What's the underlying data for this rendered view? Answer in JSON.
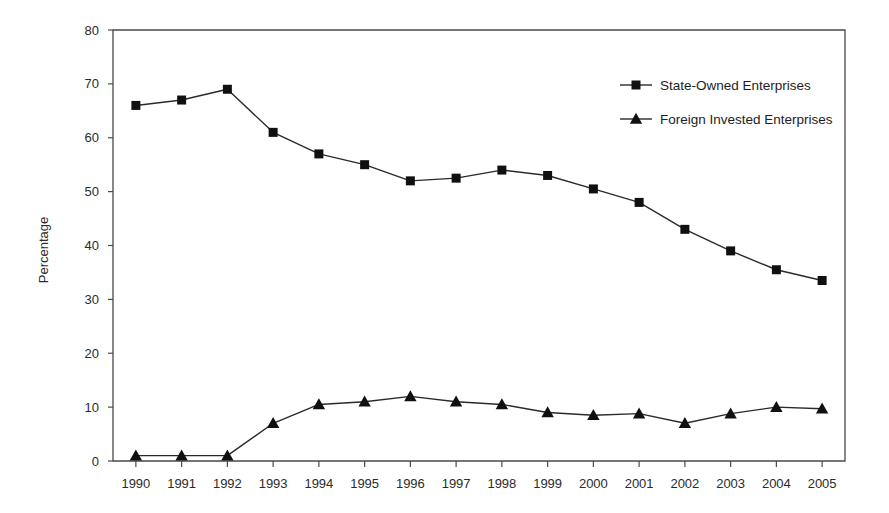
{
  "chart_data": {
    "type": "line",
    "title": "",
    "subtitle": "",
    "xlabel": "",
    "ylabel": "Percentage",
    "xlim": [
      1989.5,
      2005.5
    ],
    "ylim": [
      0,
      80
    ],
    "y_ticks": [
      0,
      10,
      20,
      30,
      40,
      50,
      60,
      70,
      80
    ],
    "grid": false,
    "legend_position": "top-right",
    "categories": [
      "1990",
      "1991",
      "1992",
      "1993",
      "1994",
      "1995",
      "1996",
      "1997",
      "1998",
      "1999",
      "2000",
      "2001",
      "2002",
      "2003",
      "2004",
      "2005"
    ],
    "series": [
      {
        "name": "State-Owned Enterprises",
        "marker": "square",
        "color": "#101010",
        "values": [
          66,
          67,
          69,
          61,
          57,
          55,
          52,
          52.5,
          54,
          53,
          50.5,
          48,
          43,
          39,
          35.5,
          33.5
        ]
      },
      {
        "name": "Foreign Invested Enterprises",
        "marker": "triangle",
        "color": "#101010",
        "values": [
          1,
          1,
          1,
          7,
          10.5,
          11,
          12,
          11,
          10.5,
          9,
          8.5,
          8.8,
          7,
          8.8,
          10,
          9.7
        ]
      }
    ]
  },
  "axes": {
    "y_label": "Percentage",
    "y_tick_labels": [
      "0",
      "10",
      "20",
      "30",
      "40",
      "50",
      "60",
      "70",
      "80"
    ],
    "x_tick_labels": [
      "1990",
      "1991",
      "1992",
      "1993",
      "1994",
      "1995",
      "1996",
      "1997",
      "1998",
      "1999",
      "2000",
      "2001",
      "2002",
      "2003",
      "2004",
      "2005"
    ]
  },
  "legend": {
    "entries": [
      {
        "label": "State-Owned Enterprises",
        "marker": "square"
      },
      {
        "label": "Foreign Invested Enterprises",
        "marker": "triangle"
      }
    ]
  }
}
